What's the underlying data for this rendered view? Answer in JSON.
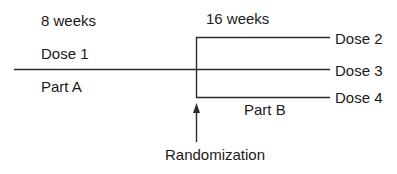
{
  "diagram": {
    "labels": {
      "part_a_duration": "8 weeks",
      "part_b_duration": "16 weeks",
      "dose_1": "Dose 1",
      "part_a": "Part A",
      "part_b": "Part B",
      "dose_2": "Dose 2",
      "dose_3": "Dose 3",
      "dose_4": "Dose 4",
      "randomization": "Randomization"
    },
    "colors": {
      "line": "#2a2a2a",
      "text": "#1a1a1a",
      "background": "#ffffff"
    }
  }
}
